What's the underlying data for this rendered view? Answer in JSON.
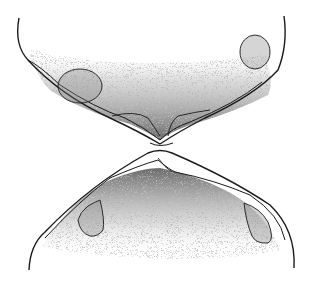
{
  "figure": {
    "colors": {
      "background": "#ffffff",
      "outline": "#1a1a1a",
      "stipple_dark": "#4a4a4a",
      "stipple_light": "#d8d8d8"
    },
    "parts": [
      {
        "name": "upper-valve",
        "position": "top"
      },
      {
        "name": "lower-valve",
        "position": "bottom"
      },
      {
        "name": "muscle-scar-upper-left"
      },
      {
        "name": "muscle-scar-upper-right"
      },
      {
        "name": "muscle-scar-lower-left"
      },
      {
        "name": "muscle-scar-lower-right"
      }
    ]
  }
}
